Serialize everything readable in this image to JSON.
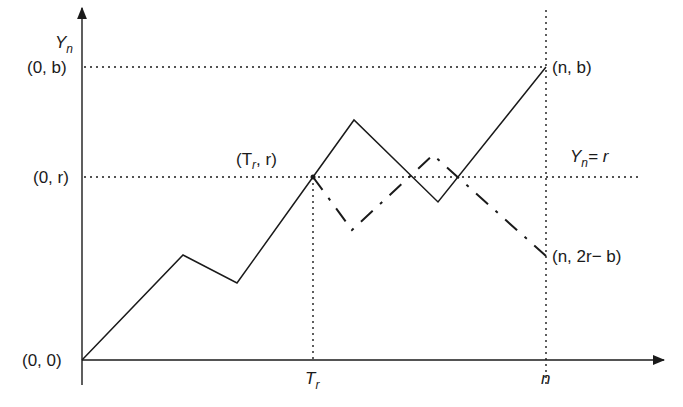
{
  "diagram": {
    "axes": {
      "y_label": "Y",
      "y_label_sub": "n",
      "x_ticks": [
        {
          "main": "T",
          "sub": "r"
        },
        {
          "main": "n",
          "sub": ""
        }
      ]
    },
    "labels": {
      "origin": "(0, 0)",
      "zero_b": "(0, b)",
      "zero_r": "(0, r)",
      "hit_point_open": "(T",
      "hit_point_sub": "r",
      "hit_point_close": ", r)",
      "end_point": "(n, b)",
      "reflected_end": "(n, 2r− b)",
      "level_line_main": "Y",
      "level_line_sub": "n",
      "level_line_rest": "= r"
    },
    "paths": {
      "original": [
        [
          82,
          360
        ],
        [
          183,
          255
        ],
        [
          237,
          283
        ],
        [
          313,
          177
        ],
        [
          354,
          120
        ],
        [
          438,
          202
        ],
        [
          546,
          67
        ]
      ],
      "reflected": [
        [
          313,
          177
        ],
        [
          352,
          230
        ],
        [
          433,
          155
        ],
        [
          546,
          256
        ]
      ]
    },
    "colors": {
      "line": "#1a1a1a",
      "background": "#ffffff"
    }
  }
}
